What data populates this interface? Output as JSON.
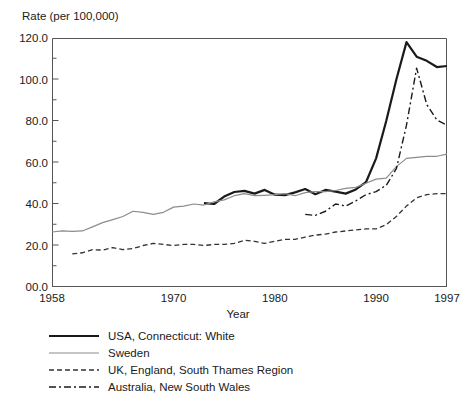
{
  "chart_data": {
    "type": "line",
    "title": "",
    "xlabel": "Year",
    "ylabel": "Rate (per 100,000)",
    "xlim": [
      1958,
      1997
    ],
    "ylim": [
      0,
      120
    ],
    "grid": false,
    "legend_position": "below-plot",
    "y_ticks": [
      {
        "value": 120,
        "label": "120.0"
      },
      {
        "value": 100,
        "label": "100.0"
      },
      {
        "value": 80,
        "label": "80.0"
      },
      {
        "value": 60,
        "label": "60.0"
      },
      {
        "value": 40,
        "label": "40.0"
      },
      {
        "value": 20,
        "label": "20.0"
      },
      {
        "value": 0,
        "label": "00.0"
      }
    ],
    "y_minor_tick_interval": 10,
    "x_ticks": [
      {
        "value": 1958,
        "label": "1958"
      },
      {
        "value": 1970,
        "label": "1970"
      },
      {
        "value": 1980,
        "label": "1980"
      },
      {
        "value": 1990,
        "label": "1990"
      },
      {
        "value": 1997,
        "label": "1997"
      }
    ],
    "x_minor_tick_interval": 1,
    "series": [
      {
        "name": "USA, Connecticut: White",
        "style": "solid-thick",
        "color": "#1a1a1a",
        "width": 2.2,
        "x": [
          1973,
          1974,
          1975,
          1976,
          1977,
          1978,
          1979,
          1980,
          1981,
          1982,
          1983,
          1984,
          1985,
          1986,
          1987,
          1988,
          1989,
          1990,
          1991,
          1992,
          1993,
          1994,
          1995,
          1996,
          1997
        ],
        "values": [
          40.4,
          40.0,
          43.6,
          45.8,
          46.3,
          45.0,
          46.8,
          44.5,
          44.3,
          45.6,
          47.2,
          44.7,
          46.8,
          46.0,
          45.0,
          47.0,
          50.5,
          62.0,
          80.0,
          100.0,
          118.0,
          111.0,
          109.0,
          106.0,
          106.5
        ]
      },
      {
        "name": "Sweden",
        "style": "solid-thin",
        "color": "#8c8c8c",
        "width": 1.2,
        "x": [
          1958,
          1959,
          1960,
          1961,
          1962,
          1963,
          1964,
          1965,
          1966,
          1967,
          1968,
          1969,
          1970,
          1971,
          1972,
          1973,
          1974,
          1975,
          1976,
          1977,
          1978,
          1979,
          1980,
          1981,
          1982,
          1983,
          1984,
          1985,
          1986,
          1987,
          1988,
          1989,
          1990,
          1991,
          1992,
          1993,
          1994,
          1995,
          1996,
          1997
        ],
        "values": [
          26.5,
          27.0,
          26.8,
          27.0,
          29.0,
          31.0,
          32.5,
          34.0,
          36.5,
          36.0,
          35.0,
          36.0,
          38.5,
          39.0,
          40.0,
          39.5,
          41.0,
          42.0,
          44.0,
          45.0,
          44.0,
          44.2,
          44.5,
          45.0,
          44.0,
          45.5,
          46.0,
          46.0,
          46.5,
          47.5,
          48.0,
          50.0,
          52.0,
          52.5,
          58.0,
          62.0,
          62.5,
          63.0,
          63.0,
          64.0
        ]
      },
      {
        "name": "UK, England, South Thames Region",
        "style": "dashed",
        "color": "#333333",
        "width": 1.3,
        "x": [
          1960,
          1961,
          1962,
          1963,
          1964,
          1965,
          1966,
          1967,
          1968,
          1969,
          1970,
          1971,
          1972,
          1973,
          1974,
          1975,
          1976,
          1977,
          1978,
          1979,
          1980,
          1981,
          1982,
          1983,
          1984,
          1985,
          1986,
          1987,
          1988,
          1989,
          1990,
          1991,
          1992,
          1993,
          1994,
          1995,
          1996,
          1997
        ],
        "values": [
          16.0,
          16.5,
          18.0,
          17.8,
          19.0,
          18.0,
          18.5,
          20.0,
          21.0,
          20.5,
          20.0,
          20.5,
          20.5,
          20.0,
          20.5,
          20.5,
          21.0,
          22.5,
          22.0,
          21.0,
          22.0,
          23.0,
          23.0,
          24.0,
          25.0,
          25.5,
          26.5,
          27.0,
          27.5,
          28.0,
          28.0,
          30.0,
          34.0,
          39.0,
          43.0,
          44.5,
          45.0,
          45.0
        ]
      },
      {
        "name": "Australia, New South Wales",
        "style": "dash-dot",
        "color": "#1a1a1a",
        "width": 1.4,
        "x": [
          1983,
          1984,
          1985,
          1986,
          1987,
          1988,
          1989,
          1990,
          1991,
          1992,
          1993,
          1994,
          1995,
          1996,
          1997
        ],
        "values": [
          35.0,
          34.5,
          36.5,
          40.0,
          39.0,
          41.5,
          44.5,
          46.0,
          49.0,
          57.0,
          78.0,
          105.5,
          88.0,
          80.5,
          78.0
        ]
      }
    ]
  },
  "axis": {
    "ylabel": "Rate (per 100,000)",
    "xlabel": "Year"
  },
  "legend": {
    "entries": [
      {
        "label": "USA, Connecticut: White",
        "style": "solid-thick"
      },
      {
        "label": "Sweden",
        "style": "solid-thin"
      },
      {
        "label": "UK, England, South Thames Region",
        "style": "dashed"
      },
      {
        "label": "Australia, New South Wales",
        "style": "dash-dot"
      }
    ]
  },
  "colors": {
    "usa": "#1a1a1a",
    "sweden": "#8c8c8c",
    "uk": "#333333",
    "australia": "#1a1a1a",
    "axis": "#555555",
    "background": "#ffffff"
  }
}
